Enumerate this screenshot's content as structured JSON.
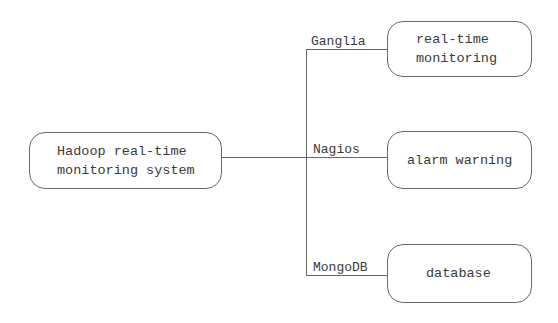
{
  "diagram": {
    "root": {
      "label": "Hadoop real-time\nmonitoring system"
    },
    "branches": [
      {
        "tool": "Ganglia",
        "function": "real-time\nmonitoring"
      },
      {
        "tool": "Nagios",
        "function": "alarm warning"
      },
      {
        "tool": "MongoDB",
        "function": "database"
      }
    ]
  },
  "colors": {
    "line": "#666666",
    "box_border": "#6a6a6a",
    "text": "#3a3a3a",
    "background": "#ffffff"
  }
}
